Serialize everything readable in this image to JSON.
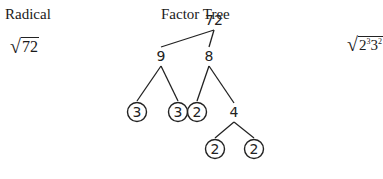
{
  "headings": {
    "radical": "Radical",
    "factor_tree": "Factor Tree"
  },
  "radical_left": {
    "symbol": "√",
    "radicand": "72"
  },
  "radical_right": {
    "symbol": "√",
    "base1": "2",
    "exp1": "3",
    "base2": "3",
    "exp2": "2"
  },
  "tree": {
    "nodes": [
      {
        "id": "n72",
        "label": "72",
        "x": 214,
        "y": 20,
        "circled": false
      },
      {
        "id": "n9",
        "label": "9",
        "x": 161,
        "y": 56,
        "circled": false
      },
      {
        "id": "n8",
        "label": "8",
        "x": 209,
        "y": 56,
        "circled": false
      },
      {
        "id": "n3a",
        "label": "3",
        "x": 137,
        "y": 112,
        "circled": true
      },
      {
        "id": "n3b",
        "label": "3",
        "x": 178,
        "y": 112,
        "circled": true
      },
      {
        "id": "n2a",
        "label": "2",
        "x": 197,
        "y": 112,
        "circled": true
      },
      {
        "id": "n4",
        "label": "4",
        "x": 234,
        "y": 112,
        "circled": false
      },
      {
        "id": "n2b",
        "label": "2",
        "x": 215,
        "y": 149,
        "circled": true
      },
      {
        "id": "n2c",
        "label": "2",
        "x": 254,
        "y": 149,
        "circled": true
      }
    ],
    "edges": [
      [
        "n72",
        "n9"
      ],
      [
        "n72",
        "n8"
      ],
      [
        "n9",
        "n3a"
      ],
      [
        "n9",
        "n3b"
      ],
      [
        "n8",
        "n2a"
      ],
      [
        "n8",
        "n4"
      ],
      [
        "n4",
        "n2b"
      ],
      [
        "n4",
        "n2c"
      ]
    ]
  }
}
